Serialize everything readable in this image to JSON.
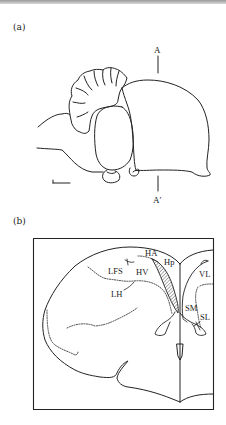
{
  "figure": {
    "panels": [
      {
        "id": "a",
        "label": "(a)",
        "view": "lateral brain outline",
        "section_marks": {
          "top": "A",
          "bottom": "A′"
        },
        "scale_bar": true
      },
      {
        "id": "b",
        "label": "(b)",
        "view": "coronal section at A–A′",
        "regions": [
          "HA",
          "Hp",
          "LFS",
          "HV",
          "LH",
          "VL",
          "SM",
          "SL"
        ]
      }
    ]
  },
  "labels": {
    "a": "(a)",
    "b": "(b)",
    "A": "A",
    "A_prime": "A′",
    "HA": "HA",
    "Hp": "Hp",
    "LFS": "LFS",
    "HV": "HV",
    "LH": "LH",
    "VL": "VL",
    "SM": "SM",
    "SL": "SL"
  },
  "colors": {
    "line": "#222222",
    "background": "#ffffff"
  }
}
